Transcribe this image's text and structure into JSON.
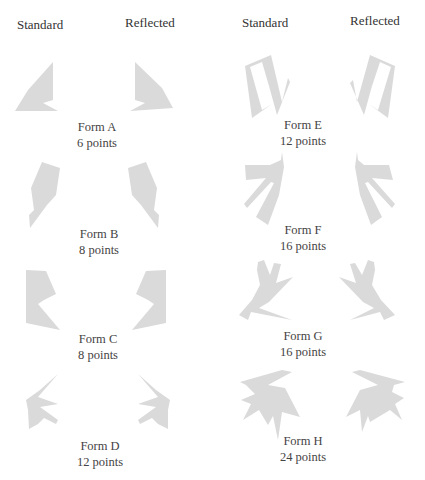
{
  "headers": {
    "left_standard": "Standard",
    "left_reflected": "Reflected",
    "right_standard": "Standard",
    "right_reflected": "Reflected"
  },
  "forms": [
    {
      "name": "Form A",
      "points": "6 points"
    },
    {
      "name": "Form B",
      "points": "8 points"
    },
    {
      "name": "Form C",
      "points": "8 points"
    },
    {
      "name": "Form D",
      "points": "12 points"
    },
    {
      "name": "Form E",
      "points": "12 points"
    },
    {
      "name": "Form F",
      "points": "16 points"
    },
    {
      "name": "Form G",
      "points": "16 points"
    },
    {
      "name": "Form H",
      "points": "24 points"
    }
  ],
  "colors": {
    "shape_fill": "#dadada",
    "text": "#444444"
  }
}
